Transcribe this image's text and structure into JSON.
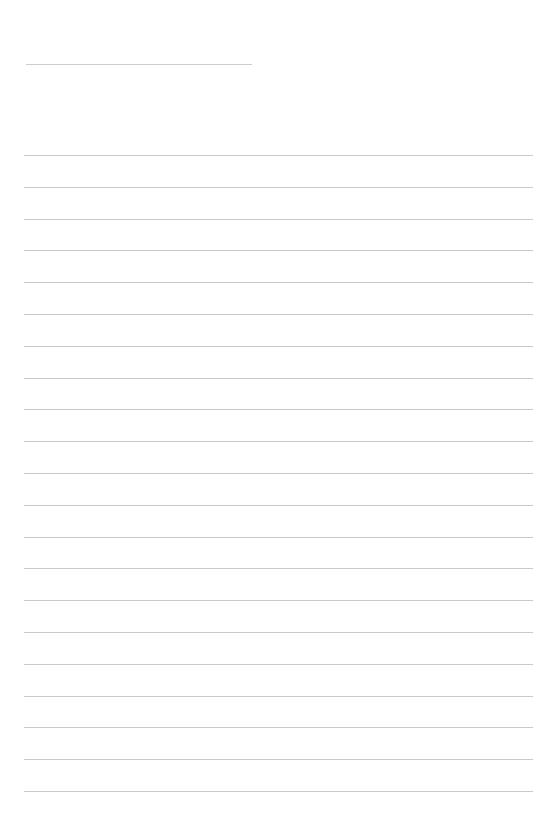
{
  "page": {
    "type": "lined-paper",
    "background": "#ffffff",
    "line_color": "#c9c9c9"
  },
  "title_line": {
    "x": 26,
    "y": 64,
    "width": 226
  },
  "ruled_lines": {
    "count": 21,
    "x": 24,
    "width": 509,
    "first_y": 155,
    "spacing": 31.8
  }
}
